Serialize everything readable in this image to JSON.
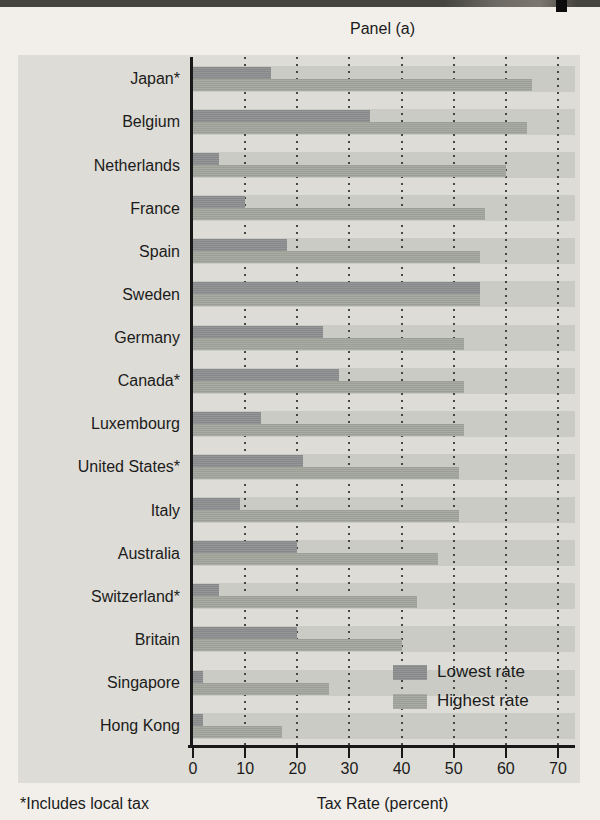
{
  "page": {
    "title": "Panel (a)",
    "footnote": "*Includes local tax"
  },
  "legend": {
    "lowest_label": "Lowest rate",
    "highest_label": "Highest rate"
  },
  "axis": {
    "ticks": [
      0,
      10,
      20,
      30,
      40,
      50,
      60,
      70
    ]
  },
  "colors": {
    "page_bg": "#f2efea",
    "figure_bg": "#dedcd6",
    "band_bg": "#cacbc5",
    "lowest_bar": "#8e8f90",
    "highest_bar": "#a4a79e",
    "axis": "#191919"
  },
  "chart_data": {
    "type": "bar",
    "orientation": "horizontal",
    "title": "Panel (a)",
    "xlabel": "Tax Rate (percent)",
    "xlim": [
      0,
      70
    ],
    "xticks": [
      0,
      10,
      20,
      30,
      40,
      50,
      60,
      70
    ],
    "grid": "dotted-vertical",
    "legend_position": "lower-right",
    "footnote": "*Includes local tax",
    "categories": [
      "Japan*",
      "Belgium",
      "Netherlands",
      "France",
      "Spain",
      "Sweden",
      "Germany",
      "Canada*",
      "Luxembourg",
      "United States*",
      "Italy",
      "Australia",
      "Switzerland*",
      "Britain",
      "Singapore",
      "Hong Kong"
    ],
    "series": [
      {
        "name": "Lowest rate",
        "values": [
          15,
          34,
          5,
          10,
          18,
          55,
          25,
          28,
          13,
          21,
          9,
          20,
          5,
          20,
          2,
          2
        ]
      },
      {
        "name": "Highest rate",
        "values": [
          65,
          64,
          60,
          56,
          55,
          55,
          52,
          52,
          52,
          51,
          51,
          47,
          43,
          40,
          26,
          17
        ]
      }
    ]
  }
}
